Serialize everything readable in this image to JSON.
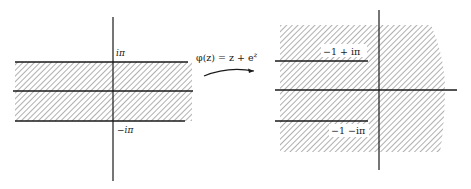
{
  "figure": {
    "left_plane": {
      "description": "Horizontal strip |Im z| < pi in the z-plane",
      "labels": {
        "top": "iπ",
        "bottom": "−iπ"
      }
    },
    "mapping": {
      "label_prefix": "φ(z) = z + e",
      "label_exponent": "z"
    },
    "right_plane": {
      "description": "Image region: plane minus two horizontal slits ending at -1 ± i pi",
      "labels": {
        "upper_slit": "−1 + iπ",
        "lower_slit": "−1 −iπ"
      }
    },
    "colors": {
      "ink": "#1a1a1a",
      "hatch": "#6e6e6e",
      "background": "#ffffff"
    }
  }
}
